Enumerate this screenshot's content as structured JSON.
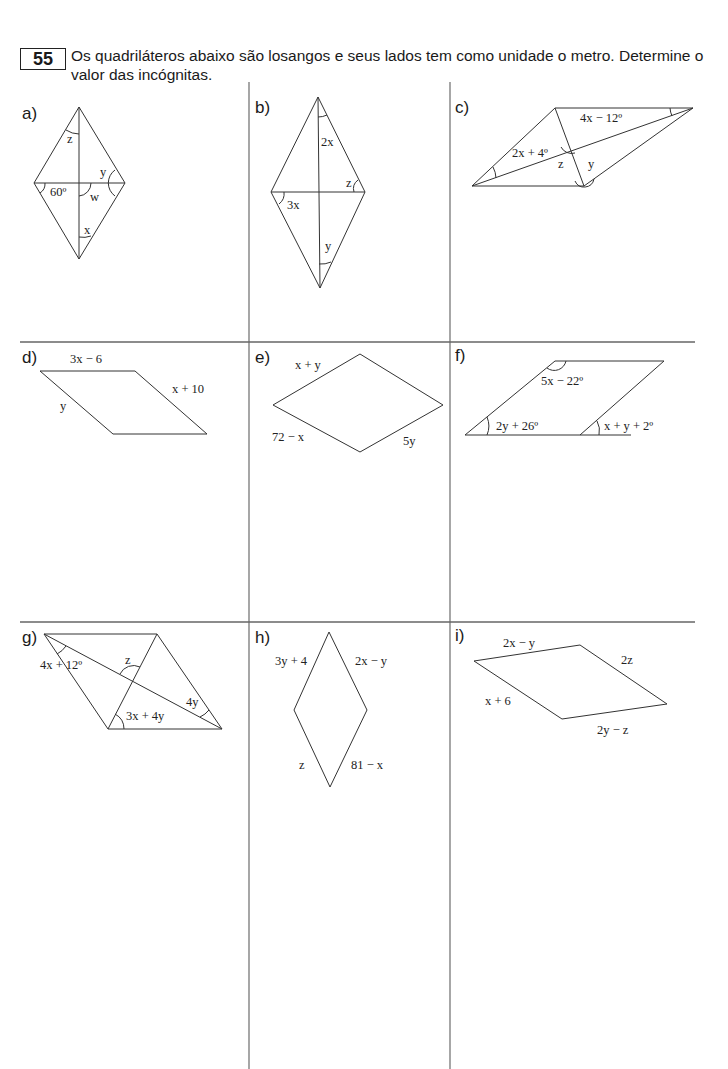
{
  "exercise": {
    "number": "55",
    "statement": "Os quadriláteros abaixo são losangos e seus lados tem como unidade o metro. Determine o valor das incógnitas."
  },
  "panels": [
    {
      "id": "a",
      "label": "a)",
      "annotations": {
        "top_angle": "z",
        "left_angle": "60º",
        "center_angle": "w",
        "right_angle": "y",
        "bottom_angle": "x"
      }
    },
    {
      "id": "b",
      "label": "b)",
      "annotations": {
        "top_angle": "2x",
        "right_angle": "z",
        "left_angle": "3x",
        "bottom_angle": "y"
      }
    },
    {
      "id": "c",
      "label": "c)",
      "annotations": {
        "top_right_angle": "4x − 12º",
        "left_angle": "2x + 4º",
        "center_angle": "z",
        "bottom_angle": "y"
      }
    },
    {
      "id": "d",
      "label": "d)",
      "annotations": {
        "top_side": "3x − 6",
        "right_side": "x + 10",
        "left_side": "y"
      }
    },
    {
      "id": "e",
      "label": "e)",
      "annotations": {
        "top_left_side": "x + y",
        "bottom_left_side": "72 − x",
        "bottom_right_side": "5y"
      }
    },
    {
      "id": "f",
      "label": "f)",
      "annotations": {
        "top_angle": "5x − 22º",
        "left_angle": "2y + 26º",
        "exterior_angle": "x + y + 2º"
      }
    },
    {
      "id": "g",
      "label": "g)",
      "annotations": {
        "top_left_angle": "4x + 12º",
        "center_angle": "z",
        "right_angle": "4y",
        "bottom_angle": "3x + 4y"
      }
    },
    {
      "id": "h",
      "label": "h)",
      "annotations": {
        "top_left_side": "3y + 4",
        "top_right_side": "2x − y",
        "bottom_left_side": "z",
        "bottom_right_side": "81 − x"
      }
    },
    {
      "id": "i",
      "label": "i)",
      "annotations": {
        "top_side": "2x − y",
        "right_side": "2z",
        "left_side": "x + 6",
        "bottom_side": "2y − z"
      }
    }
  ]
}
